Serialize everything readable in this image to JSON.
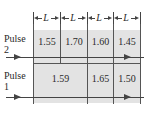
{
  "dimension_label": "L",
  "pulse2": {
    "label_line1": "Pulse",
    "label_line2": "2",
    "cells": [
      "1.55",
      "1.70",
      "1.60",
      "1.45"
    ]
  },
  "pulse1": {
    "label_line1": "Pulse",
    "label_line2": "1",
    "cells": [
      "1.59",
      "1.65",
      "1.50"
    ]
  },
  "colors": {
    "slab": "#e3e3e3",
    "lines": "#555555"
  }
}
